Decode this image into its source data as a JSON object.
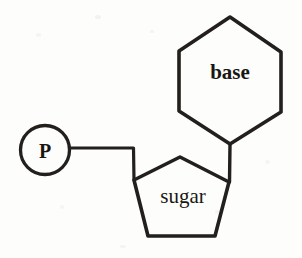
{
  "diagram": {
    "type": "schematic-line-drawing",
    "background_color": "#fdfdfc",
    "ink_color": "#221f1c",
    "stroke_width": 3.2,
    "components": {
      "phosphate": {
        "label": "P",
        "shape": "circle",
        "data_name": "phosphate-group",
        "cx": 45,
        "cy": 150,
        "r": 24.5,
        "label_x": 45,
        "label_y": 158
      },
      "base": {
        "label": "base",
        "shape": "hexagon",
        "data_name": "nitrogenous-base",
        "points": "230,17 281,52 281,112 230,144 179,111 179,51",
        "label_x": 230,
        "label_y": 79
      },
      "sugar": {
        "label": "sugar",
        "shape": "pentagon",
        "data_name": "sugar-group",
        "points": "180,157 229,182 215,236 148,236 134,180",
        "label_x": 183,
        "label_y": 203
      }
    },
    "bonds": [
      {
        "data_name": "bond-phosphate-to-sugar",
        "path": "M 70 148 L 133.5 148 L 134 180",
        "from": "phosphate",
        "to": "sugar"
      },
      {
        "data_name": "bond-base-to-sugar",
        "path": "M 230 144 L 229.5 182",
        "from": "base",
        "to": "sugar"
      }
    ]
  }
}
